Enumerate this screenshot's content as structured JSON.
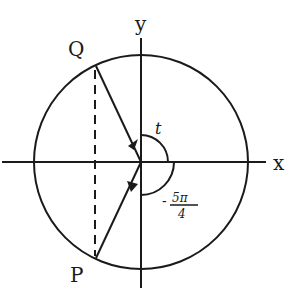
{
  "diagram": {
    "axis_labels": {
      "x": "x",
      "y": "y"
    },
    "points": {
      "Q": "Q",
      "P": "P"
    },
    "angles": {
      "t": "t",
      "neg_num": "5π",
      "neg_den": "4",
      "neg_sign": "-"
    },
    "top_fragment": "p 4"
  }
}
